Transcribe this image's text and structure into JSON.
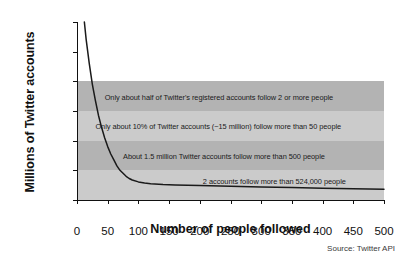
{
  "chart_data": {
    "type": "line",
    "title": "",
    "xlabel": "Number of people followed",
    "ylabel": "Millions of Twitter accounts",
    "xlim": [
      0,
      500
    ],
    "ylim": [
      0,
      120
    ],
    "grid": false,
    "legend": "none",
    "source": "Source: Twitter API",
    "xticks": [
      0,
      50,
      100,
      150,
      200,
      250,
      300,
      350,
      400,
      450,
      500
    ],
    "yticks": [
      0,
      20,
      40,
      60,
      80,
      100,
      120
    ],
    "series": [
      {
        "name": "Twitter accounts by number followed",
        "x": [
          12,
          15,
          20,
          25,
          30,
          35,
          40,
          45,
          50,
          55,
          60,
          65,
          70,
          75,
          80,
          85,
          90,
          100,
          110,
          120,
          140,
          160,
          180,
          200,
          250,
          300,
          350,
          400,
          450,
          500
        ],
        "y": [
          120,
          108,
          92,
          78,
          67,
          57,
          49,
          42,
          36,
          31,
          27,
          23,
          20,
          18,
          16,
          14.5,
          13.5,
          12.2,
          11.5,
          11.0,
          10.4,
          10.1,
          9.9,
          9.7,
          9.2,
          8.8,
          8.4,
          8.0,
          7.6,
          7.2
        ]
      }
    ],
    "bands": [
      {
        "y0": 60,
        "y1": 80,
        "shade": "#b3b3b3"
      },
      {
        "y0": 40,
        "y1": 60,
        "shade": "#cbcbcb"
      },
      {
        "y0": 20,
        "y1": 40,
        "shade": "#b3b3b3"
      },
      {
        "y0": 0,
        "y1": 20,
        "shade": "#cbcbcb"
      }
    ],
    "annotations": [
      {
        "text": "Only about half of Twitter's registered accounts follow 2 or more people",
        "x": 45,
        "y": 69
      },
      {
        "text": "Only about 10% of Twitter accounts (~15 million) follow more than 50 people",
        "x": 30,
        "y": 49
      },
      {
        "text": "About 1.5 million Twitter accounts follow more than 500 people",
        "x": 75,
        "y": 29
      },
      {
        "text": "2 accounts follow more than 524,000 people",
        "x": 205,
        "y": 12
      }
    ]
  }
}
